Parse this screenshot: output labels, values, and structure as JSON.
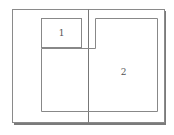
{
  "diagram": {
    "type": "page-spread-layout",
    "colors": {
      "background": "#ffffff",
      "page_fill": "#ffffff",
      "page_border": "#8a8a8a",
      "page_shadow": "#7a7a7a",
      "frame_border": "#888888",
      "spine": "#777777",
      "label": "#555555"
    },
    "frames": [
      {
        "id": "frame-1",
        "label": "1"
      },
      {
        "id": "frame-2",
        "label": "2"
      }
    ]
  }
}
